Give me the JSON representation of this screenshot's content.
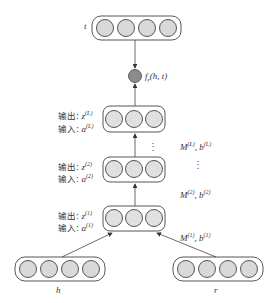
{
  "diagram": {
    "nodes": {
      "t": {
        "label": "t",
        "units": 4
      },
      "h": {
        "label": "h",
        "units": 4
      },
      "r": {
        "label": "r",
        "units": 4
      },
      "layer_L": {
        "units": 3,
        "output_label": "输出: ",
        "output_var": "z",
        "input_label": "输入: ",
        "input_var": "a",
        "sup": "(L)"
      },
      "layer_2": {
        "units": 3,
        "output_label": "输出: ",
        "output_var": "z",
        "input_label": "输入: ",
        "input_var": "a",
        "sup": "(2)"
      },
      "layer_1": {
        "units": 3,
        "output_label": "输出: ",
        "output_var": "z",
        "input_label": "输入: ",
        "input_var": "a",
        "sup": "(1)"
      },
      "score": {
        "label": "f",
        "sub": "r",
        "args": "(h, t)"
      }
    },
    "params": [
      {
        "M": "M",
        "sup_m": "(L)",
        "b": ", b",
        "sup_b": "(L)"
      },
      {
        "M": "M",
        "sup_m": "(2)",
        "b": ", b",
        "sup_b": "(2)"
      },
      {
        "M": "M",
        "sup_m": "(1)",
        "b": ", b",
        "sup_b": "(1)"
      }
    ],
    "ellipsis": "⋮",
    "colors": {
      "unit_fill": "#d9d9d9",
      "score_fill": "#8c8c8c",
      "stroke": "#444444"
    }
  }
}
